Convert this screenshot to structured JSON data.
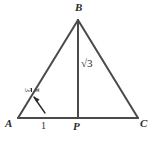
{
  "figure": {
    "type": "geometry-diagram",
    "background_color": "#ffffff",
    "stroke_color": "#4a4a4a",
    "text_color": "#2b2b2b",
    "stroke_width": 2
  },
  "vertices": {
    "B": {
      "label": "B",
      "x": 78,
      "y": 20
    },
    "A": {
      "label": "A",
      "x": 18,
      "y": 118
    },
    "P": {
      "label": "P",
      "x": 78,
      "y": 118
    },
    "C": {
      "label": "C",
      "x": 138,
      "y": 118
    }
  },
  "measurements": {
    "base_segment": {
      "label": "1",
      "description": "length of AP"
    },
    "altitude": {
      "label": "√3",
      "radical": "√",
      "radicand": "3",
      "description": "length of BP"
    },
    "angle_at_A": {
      "numerator": "π",
      "denominator": "3",
      "label": "π/3",
      "description": "interior angle BAC"
    }
  },
  "annotations": {
    "angle_arc": "curved arc with arrowhead pointing to angle at vertex A"
  }
}
